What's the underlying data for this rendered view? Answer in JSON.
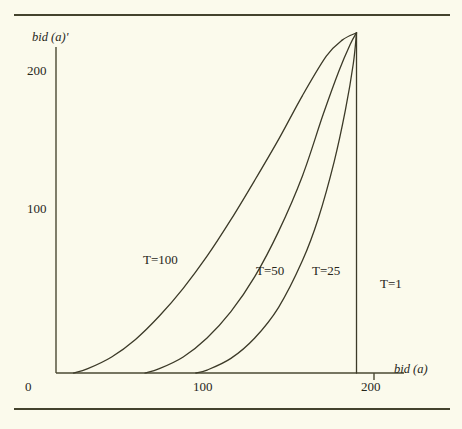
{
  "figure": {
    "background_color": "#fbfaec",
    "ink_color": "#4a4833",
    "rules": {
      "top": "horizontal-rule",
      "bottom": "horizontal-rule"
    }
  },
  "chart_data": {
    "type": "line",
    "title": "",
    "xlabel": "bid (a)",
    "ylabel": "bid (a)'",
    "xlim": [
      0,
      240
    ],
    "ylim": [
      0,
      260
    ],
    "xticks": [
      0,
      100,
      200
    ],
    "xtick_labels": [
      "0",
      "100",
      "200"
    ],
    "yticks": [
      100,
      200
    ],
    "ytick_labels": [
      "100",
      "200"
    ],
    "grid": false,
    "legend_position": "inline-curve-labels",
    "annotations": [
      {
        "text": "T=100",
        "x": 60,
        "y": 72
      },
      {
        "text": "T=50",
        "x": 126,
        "y": 65
      },
      {
        "text": "T=25",
        "x": 159,
        "y": 65
      },
      {
        "text": "T=1",
        "x": 200,
        "y": 57
      }
    ],
    "series": [
      {
        "name": "T=100",
        "label": "T=100",
        "x": [
          11,
          20,
          35,
          50,
          65,
          80,
          95,
          110,
          125,
          140,
          155,
          170,
          180,
          189
        ],
        "y": [
          0,
          3,
          11,
          23,
          39,
          58,
          80,
          105,
          132,
          160,
          190,
          217,
          228,
          233
        ]
      },
      {
        "name": "T=50",
        "label": "T=50",
        "x": [
          56,
          65,
          80,
          95,
          110,
          125,
          140,
          155,
          168,
          178,
          185,
          189
        ],
        "y": [
          0,
          3,
          11,
          24,
          42,
          66,
          97,
          135,
          177,
          207,
          225,
          233
        ]
      },
      {
        "name": "T=25",
        "label": "T=25",
        "x": [
          88,
          95,
          110,
          125,
          140,
          155,
          165,
          175,
          182,
          187,
          189
        ],
        "y": [
          0,
          2,
          10,
          24,
          45,
          77,
          106,
          145,
          180,
          212,
          233
        ]
      },
      {
        "name": "T=1",
        "label": "T=1",
        "x": [
          189,
          189
        ],
        "y": [
          0,
          233
        ]
      }
    ]
  }
}
